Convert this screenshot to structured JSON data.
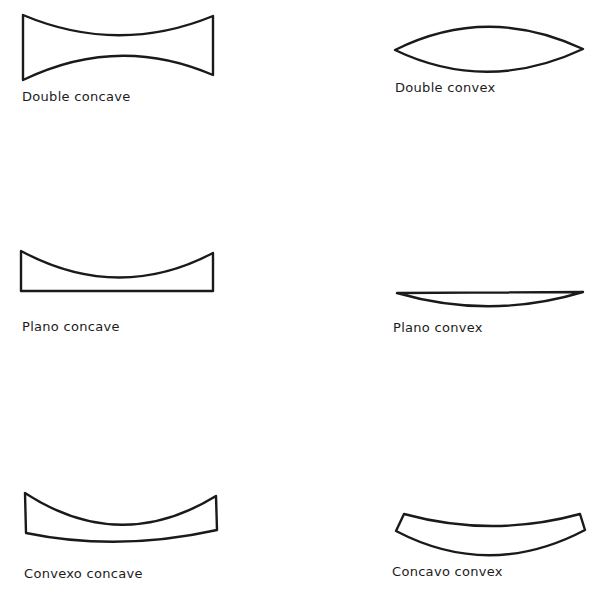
{
  "diagram": {
    "lenses": [
      {
        "id": "double-concave",
        "label": "Double concave"
      },
      {
        "id": "double-convex",
        "label": "Double convex"
      },
      {
        "id": "plano-concave",
        "label": "Plano concave"
      },
      {
        "id": "plano-convex",
        "label": "Plano convex"
      },
      {
        "id": "convexo-concave",
        "label": "Convexo concave"
      },
      {
        "id": "concavo-convex",
        "label": "Concavo convex"
      }
    ]
  }
}
